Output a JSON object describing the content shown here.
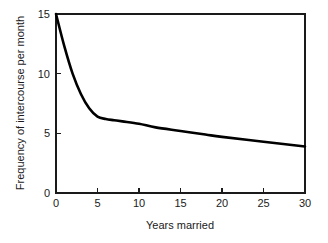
{
  "chart_data": {
    "type": "line",
    "title": "",
    "subtitle": "",
    "xlabel": "Years married",
    "ylabel": "Frequency of intercourse per month",
    "xlim": [
      0,
      30
    ],
    "ylim": [
      0,
      15
    ],
    "xticks": [
      0,
      5,
      10,
      15,
      20,
      25,
      30
    ],
    "yticks": [
      0,
      5,
      10,
      15
    ],
    "xtick_labels": [
      "0",
      "5",
      "10",
      "15",
      "20",
      "25",
      "30"
    ],
    "ytick_labels": [
      "0",
      "5",
      "10",
      "15"
    ],
    "grid": false,
    "legend": false,
    "legend_position": "none",
    "tick_direction": "in",
    "frame": "full-box",
    "line_color": "#000000",
    "background_color": "#ffffff",
    "series": [
      {
        "name": "Frequency of intercourse per month",
        "x": [
          0,
          1,
          2,
          3,
          4,
          5,
          6,
          7,
          8,
          10,
          12,
          15,
          18,
          20,
          25,
          30
        ],
        "values": [
          15.0,
          12.3,
          10.0,
          8.3,
          7.1,
          6.4,
          6.2,
          6.1,
          6.0,
          5.8,
          5.5,
          5.2,
          4.9,
          4.7,
          4.3,
          3.9
        ]
      }
    ],
    "annotations": []
  },
  "axes": {
    "x_title": "Years married",
    "y_title": "Frequency of intercourse per month"
  }
}
